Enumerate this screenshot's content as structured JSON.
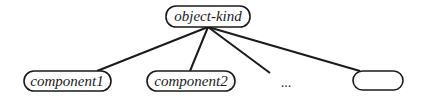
{
  "diagram": {
    "type": "tree",
    "root": {
      "label": "object-kind"
    },
    "children": [
      {
        "label": "component1"
      },
      {
        "label": "component2"
      },
      {
        "label": "..."
      },
      {
        "label": ""
      }
    ]
  },
  "colors": {
    "stroke": "#1a1a1a",
    "background": "#ffffff"
  }
}
